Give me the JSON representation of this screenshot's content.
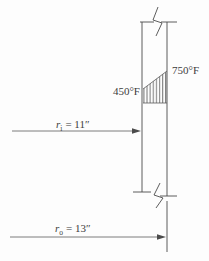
{
  "figure": {
    "temperatures": {
      "inner_label": "450°F",
      "outer_label": "750°F"
    },
    "inner_radius": {
      "symbol": "r",
      "subscript": "i",
      "value": "= 11″"
    },
    "outer_radius": {
      "symbol": "r",
      "subscript": "o",
      "value": "= 13″"
    },
    "colors": {
      "line": "#4b4b4b",
      "text": "#3c3c3c",
      "background": "#fdfdfd"
    }
  }
}
